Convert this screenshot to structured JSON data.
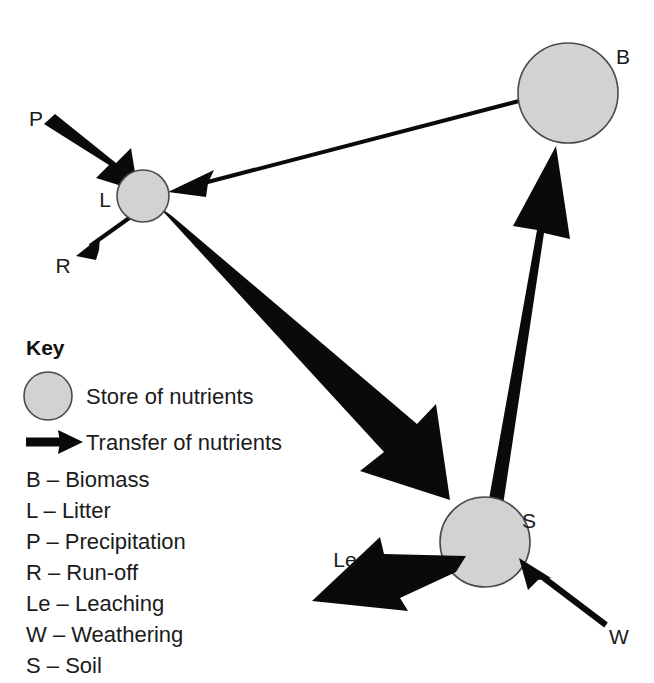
{
  "diagram": {
    "background_color": "#ffffff",
    "store_fill_color": "#d2d2d2",
    "store_stroke_color": "#4a4a4a",
    "flow_color": "#0a0a0a",
    "nodes": [
      {
        "id": "B",
        "label": "B",
        "name": "Biomass",
        "cx": 568,
        "cy": 93,
        "r": 50
      },
      {
        "id": "L",
        "label": "L",
        "name": "Litter",
        "cx": 143,
        "cy": 196,
        "r": 26
      },
      {
        "id": "S",
        "label": "S",
        "name": "Soil",
        "cx": 485,
        "cy": 542,
        "r": 45
      }
    ],
    "flows": [
      {
        "id": "P",
        "label": "P",
        "name": "Precipitation",
        "from": "external",
        "to": "L",
        "weight": "thick"
      },
      {
        "id": "R",
        "label": "R",
        "name": "Run-off",
        "from": "L",
        "to": "external",
        "weight": "thin"
      },
      {
        "id": "BL",
        "label": "",
        "name": "Biomass to Litter",
        "from": "B",
        "to": "L",
        "weight": "thin"
      },
      {
        "id": "LS",
        "label": "",
        "name": "Litter to Soil",
        "from": "L",
        "to": "S",
        "weight": "thick"
      },
      {
        "id": "SB",
        "label": "",
        "name": "Soil to Biomass",
        "from": "S",
        "to": "B",
        "weight": "thick"
      },
      {
        "id": "Le",
        "label": "Le",
        "name": "Leaching",
        "from": "S",
        "to": "external",
        "weight": "thick"
      },
      {
        "id": "W",
        "label": "W",
        "name": "Weathering",
        "from": "external",
        "to": "S",
        "weight": "thin"
      }
    ]
  },
  "key": {
    "title": "Key",
    "store_label": "Store of nutrients",
    "transfer_label": "Transfer of nutrients",
    "abbreviations": [
      "B – Biomass",
      "L – Litter",
      "P – Precipitation",
      "R – Run-off",
      "Le – Leaching",
      "W – Weathering",
      "S – Soil"
    ]
  }
}
